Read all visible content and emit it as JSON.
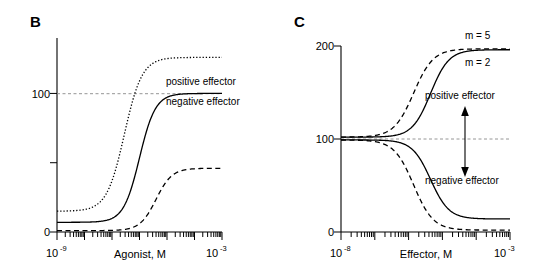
{
  "figure": {
    "panels": [
      {
        "letter": "B",
        "xaxis": {
          "title": "Agonist, M",
          "min_label_base": "10",
          "min_label_exp": "-9",
          "max_label_base": "10",
          "max_label_exp": "-3",
          "log_min": -9,
          "log_max": -3,
          "scale": "log"
        },
        "yaxis": {
          "ticks": [
            {
              "value": 0,
              "label": "0"
            },
            {
              "value": 50,
              "label": ""
            },
            {
              "value": 100,
              "label": "100"
            }
          ],
          "min": 0,
          "max": 140
        },
        "reference_line": {
          "value": 100
        },
        "annotations": [
          {
            "name": "positive-effector-label",
            "text": "positive effector"
          },
          {
            "name": "negative-effector-label",
            "text": "negative effector"
          }
        ]
      },
      {
        "letter": "C",
        "xaxis": {
          "title": "Effector, M",
          "min_label_base": "10",
          "min_label_exp": "-8",
          "max_label_base": "10",
          "max_label_exp": "-3",
          "log_min": -8,
          "log_max": -3,
          "scale": "log"
        },
        "yaxis": {
          "ticks": [
            {
              "value": 0,
              "label": "0"
            },
            {
              "value": 100,
              "label": "100"
            },
            {
              "value": 200,
              "label": "200"
            }
          ],
          "min": 0,
          "max": 200
        },
        "reference_line": {
          "value": 100
        },
        "annotations": [
          {
            "name": "m5-label",
            "text": "m = 5"
          },
          {
            "name": "m2-label",
            "text": "m = 2"
          },
          {
            "name": "positive-effector-label",
            "text": "positive effector"
          },
          {
            "name": "negative-effector-label",
            "text": "negative effector"
          }
        ]
      }
    ]
  },
  "chart_data": [
    {
      "type": "line",
      "panel": "B",
      "title": "",
      "xlabel": "Agonist, M",
      "ylabel": "",
      "xscale": "log",
      "xlim": [
        -9,
        -3
      ],
      "ylim": [
        0,
        140
      ],
      "grid": false,
      "reference_line_y": 100,
      "yticks": [
        0,
        50,
        100
      ],
      "ytick_labels": [
        "0",
        "",
        "100"
      ],
      "xtick_labels": [
        "10-9",
        "10-3"
      ],
      "legend_position": "inline-right",
      "series": [
        {
          "name": "positive effector",
          "style": "dotted",
          "model": "sigmoid",
          "bottom": 15,
          "top": 126,
          "logEC50": -6.55,
          "hill": 1.35
        },
        {
          "name": "control",
          "style": "solid",
          "model": "sigmoid",
          "bottom": 7,
          "top": 100,
          "logEC50": -6.0,
          "hill": 1.5
        },
        {
          "name": "negative effector",
          "style": "dashed",
          "model": "sigmoid",
          "bottom": 1,
          "top": 46,
          "logEC50": -5.4,
          "hill": 1.5
        }
      ]
    },
    {
      "type": "line",
      "panel": "C",
      "title": "",
      "xlabel": "Effector, M",
      "ylabel": "",
      "xscale": "log",
      "xlim": [
        -8,
        -3
      ],
      "ylim": [
        0,
        200
      ],
      "grid": false,
      "reference_line_y": 100,
      "yticks": [
        0,
        100,
        200
      ],
      "ytick_labels": [
        "0",
        "100",
        "200"
      ],
      "xtick_labels": [
        "10-8",
        "10-3"
      ],
      "legend_position": "inline-right",
      "series": [
        {
          "name": "positive effector m = 5",
          "style": "dashed",
          "model": "sigmoid",
          "bottom": 102,
          "top": 197,
          "logEC50": -5.85,
          "hill": 1.5
        },
        {
          "name": "positive effector m = 2",
          "style": "solid",
          "model": "sigmoid",
          "bottom": 102,
          "top": 196,
          "logEC50": -5.35,
          "hill": 1.6
        },
        {
          "name": "negative effector m = 5",
          "style": "dashed",
          "model": "sigmoid",
          "bottom": 99,
          "top": 2,
          "logEC50": -5.85,
          "hill": 1.5
        },
        {
          "name": "negative effector m = 2",
          "style": "solid",
          "model": "sigmoid",
          "bottom": 99,
          "top": 14,
          "logEC50": -5.35,
          "hill": 1.6
        }
      ]
    }
  ]
}
